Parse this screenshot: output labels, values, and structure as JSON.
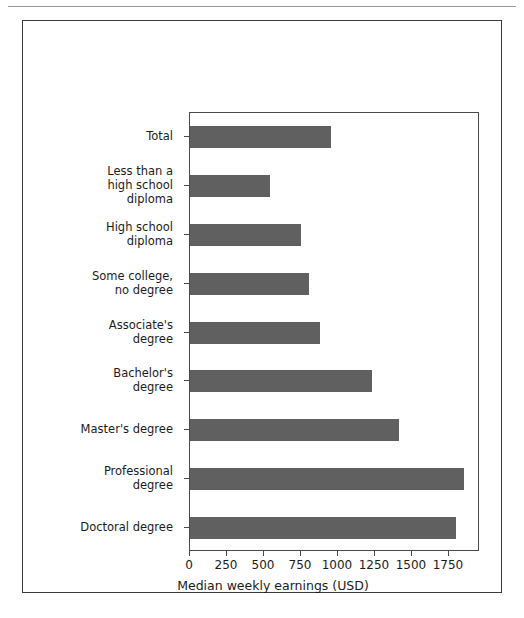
{
  "page": {
    "top_artifact_text": "",
    "background_color": "#ffffff"
  },
  "figure": {
    "frame_color": "#3b3b3b",
    "axes_color": "#4a4a4a",
    "bar_color": "#606060"
  },
  "chart_data": {
    "type": "bar",
    "orientation": "horizontal",
    "title": "",
    "xlabel": "Median weekly earnings (USD)",
    "ylabel": "",
    "categories": [
      "Total",
      "Less than a\nhigh school\ndiploma",
      "High school\ndiploma",
      "Some college,\nno degree",
      "Associate's\ndegree",
      "Bachelor's\ndegree",
      "Master's degree",
      "Professional\ndegree",
      "Doctoral degree"
    ],
    "values": [
      950,
      540,
      750,
      805,
      880,
      1230,
      1410,
      1850,
      1800
    ],
    "xlim": [
      0,
      1960
    ],
    "xticks": [
      0,
      250,
      500,
      750,
      1000,
      1250,
      1500,
      1750
    ],
    "xticklabels": [
      "0",
      "250",
      "500",
      "750",
      "1000",
      "1250",
      "1500",
      "1750"
    ],
    "grid": false,
    "legend": null,
    "bar_color": "#606060"
  }
}
